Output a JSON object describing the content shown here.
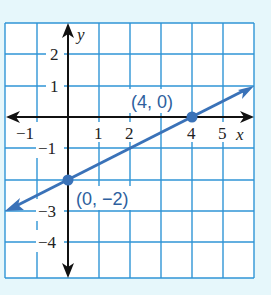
{
  "graph": {
    "x_axis_label": "x",
    "y_axis_label": "y",
    "x_ticks": [
      "−1",
      "1",
      "2",
      "4",
      "5"
    ],
    "y_ticks": [
      "2",
      "1",
      "−1",
      "−3",
      "−4"
    ],
    "points": [
      {
        "label": "(4, 0)",
        "x": 4,
        "y": 0
      },
      {
        "label": "(0, −2)",
        "x": 0,
        "y": -2
      }
    ],
    "line": {
      "slope": 0.5,
      "intercept": -2,
      "color": "#3a72b8"
    },
    "grid_color": "#2f95d6",
    "background": "#e6f7fb"
  }
}
